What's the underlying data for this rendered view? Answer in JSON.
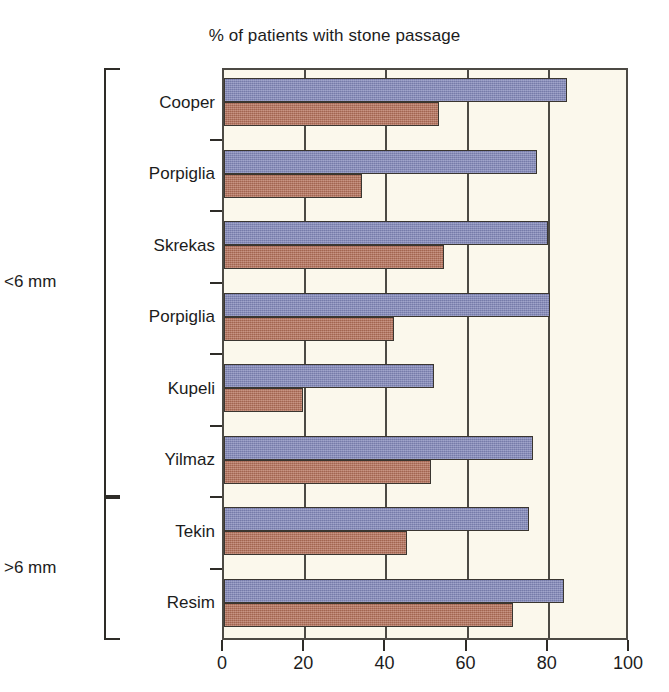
{
  "chart_data": {
    "type": "bar",
    "orientation": "horizontal",
    "title": "% of patients with stone passage",
    "xlabel": "",
    "ylabel": "",
    "xlim": [
      0,
      100
    ],
    "xticks": [
      0,
      20,
      40,
      60,
      80,
      100
    ],
    "xtick_labels": [
      "0",
      "20",
      "40",
      "60",
      "80",
      "100"
    ],
    "grid": true,
    "legend": null,
    "categories": [
      "Cooper",
      "Porpiglia",
      "Skrekas",
      "Porpiglia",
      "Kupeli",
      "Yilmaz",
      "Tekin",
      "Resim"
    ],
    "series": [
      {
        "name": "blue",
        "color": "#8187b9",
        "values": [
          84.6,
          77.2,
          79.9,
          80.3,
          51.8,
          76.2,
          75.0,
          83.7
        ]
      },
      {
        "name": "red",
        "color": "#b5715a",
        "values": [
          52.9,
          33.9,
          54.2,
          41.9,
          19.5,
          51.1,
          45.0,
          71.2
        ]
      }
    ],
    "groups": [
      {
        "label": "<6 mm",
        "categories": [
          "Cooper",
          "Porpiglia",
          "Skrekas",
          "Porpiglia",
          "Kupeli",
          "Yilmaz"
        ],
        "start_index": 0,
        "end_index": 5
      },
      {
        "label": ">6 mm",
        "categories": [
          "Tekin",
          "Resim"
        ],
        "start_index": 6,
        "end_index": 7
      }
    ],
    "colors": {
      "bar_blue": "#8187b9",
      "bar_red": "#b5715a",
      "plot_background": "#fbf8ec",
      "axis": "#4c4a44",
      "text": "#1c1c1c",
      "page_background": "#ffffff"
    }
  }
}
